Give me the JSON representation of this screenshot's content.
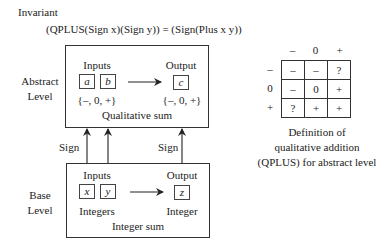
{
  "invariant": {
    "label": "Invariant",
    "equation": "(QPLUS(Sign x)(Sign y)) = (Sign(Plus x y))"
  },
  "abstract_level": {
    "label_line1": "Abstract",
    "label_line2": "Level",
    "inputs_label": "Inputs",
    "output_label": "Output",
    "input_vars": [
      "a",
      "b"
    ],
    "output_var": "c",
    "input_domain": "{–, 0, +}",
    "output_domain": "{–, 0, +}",
    "operation": "Qualitative sum"
  },
  "mapping": {
    "left_label": "Sign",
    "right_label": "Sign"
  },
  "base_level": {
    "label_line1": "Base",
    "label_line2": "Level",
    "inputs_label": "Inputs",
    "output_label": "Output",
    "input_vars": [
      "x",
      "y"
    ],
    "output_var": "z",
    "input_domain": "Integers",
    "output_domain": "Integer",
    "operation": "Integer sum"
  },
  "qplus_table": {
    "col_headers": [
      "–",
      "0",
      "+"
    ],
    "row_headers": [
      "–",
      "0",
      "+"
    ],
    "rows": [
      [
        "–",
        "–",
        "?"
      ],
      [
        "–",
        "0",
        "+"
      ],
      [
        "?",
        "+",
        "+"
      ]
    ],
    "caption_line1": "Definition of",
    "caption_line2": "qualitative addition",
    "caption_line3": "(QPLUS) for abstract level"
  }
}
